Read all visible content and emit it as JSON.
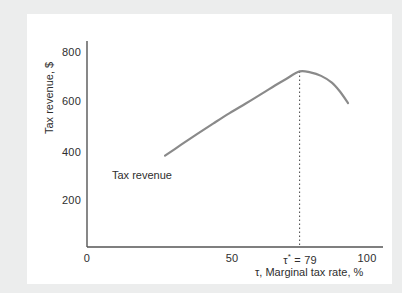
{
  "chart_data": {
    "type": "line",
    "title": "",
    "xlabel": "τ, Marginal tax rate, %",
    "ylabel": "Tax revenue, $",
    "xlim": [
      0,
      110
    ],
    "ylim": [
      0,
      880
    ],
    "grid": false,
    "legend_position": "inline-annotation",
    "series": [
      {
        "name": "Tax revenue",
        "color": "#8a8a8a",
        "x": [
          29,
          35,
          41,
          47,
          53,
          59,
          65,
          70,
          74,
          79,
          83,
          87,
          91,
          94,
          97
        ],
        "y": [
          390,
          437,
          483,
          528,
          572,
          613,
          655,
          691,
          718,
          750,
          746,
          731,
          702,
          664,
          615
        ]
      }
    ],
    "xticks": [
      {
        "value": 0,
        "label": "0"
      },
      {
        "value": 50,
        "label": "50"
      },
      {
        "value": 79,
        "label": "τ* = 79"
      },
      {
        "value": 100,
        "label": "100"
      }
    ],
    "yticks": [
      {
        "value": 200,
        "label": "200"
      },
      {
        "value": 400,
        "label": "400"
      },
      {
        "value": 600,
        "label": "600"
      },
      {
        "value": 800,
        "label": "800"
      }
    ],
    "annotations": [
      {
        "name": "curve-label",
        "text": "Tax revenue",
        "x": 38,
        "y": 300
      },
      {
        "name": "optimal-rate-marker",
        "text": "τ* = 79",
        "x": 79,
        "style": "dotted-vertical-line",
        "color": "#555555"
      }
    ]
  },
  "axis_titles": {
    "x": "τ, Marginal tax rate, %",
    "y": "Tax revenue, $"
  },
  "tau_star": {
    "symbol": "τ",
    "star": "*",
    "equals": " = 79",
    "full": "τ* = 79"
  },
  "ticks": {
    "y": [
      "800",
      "600",
      "400",
      "200"
    ],
    "x_zero": "0",
    "x_fifty": "50",
    "x_hundred": "100"
  },
  "curve_label": "Tax revenue",
  "colors": {
    "curve": "#8a8a8a",
    "axis": "#555555",
    "text": "#2e2e2e",
    "panel": "#ffffff",
    "background": "#eceded"
  }
}
